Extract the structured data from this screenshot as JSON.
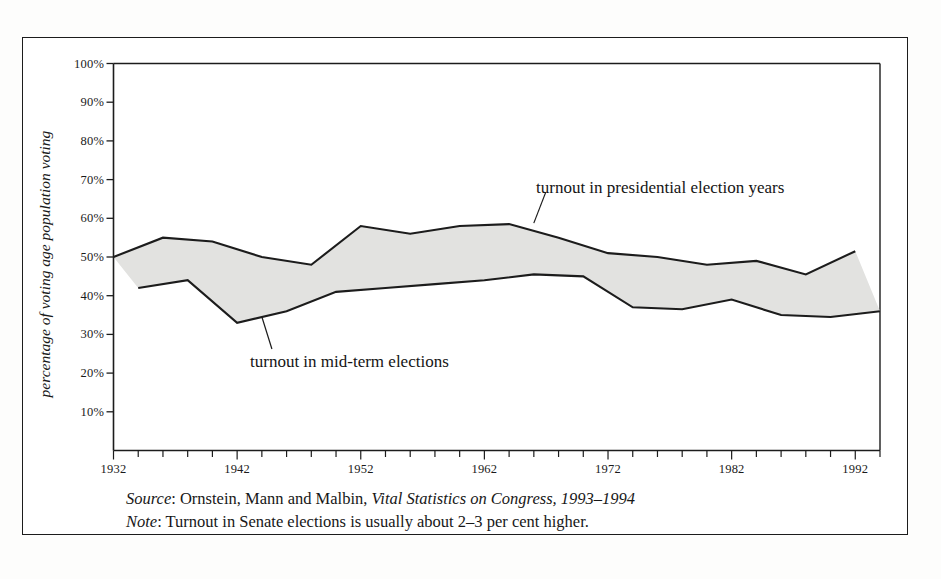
{
  "figure": {
    "y_axis_title": "percentage of voting age population voting",
    "annotations": {
      "presidential": "turnout in presidential election years",
      "midterm": "turnout in mid-term elections"
    },
    "footnotes": {
      "source_label": "Source",
      "source_sep": ": ",
      "source_text_a": "Ornstein, Mann and Malbin, ",
      "source_text_italic": "Vital Statistics on Congress, 1993–1994",
      "note_label": "Note",
      "note_sep": ": ",
      "note_text": "Turnout in Senate elections is usually about 2–3 per cent higher."
    },
    "colors": {
      "line": "#1c1c1c",
      "fill": "#e2e2e0",
      "frame": "#1c1c1c",
      "text": "#1a1a1a",
      "page": "#fdfdfc"
    }
  },
  "chart_data": {
    "type": "area",
    "title": "",
    "subtitle": "",
    "xlabel": "",
    "ylabel": "percentage of voting age population voting",
    "xlim": [
      1932,
      1994
    ],
    "ylim": [
      0,
      100
    ],
    "grid": false,
    "legend_position": "inline-annotations",
    "y_ticks": [
      10,
      20,
      30,
      40,
      50,
      60,
      70,
      80,
      90,
      100
    ],
    "y_tick_labels": [
      "10%",
      "20%",
      "30%",
      "40%",
      "50%",
      "60%",
      "70%",
      "80%",
      "90%",
      "100%"
    ],
    "x_ticks_minor_step": 2,
    "x_tick_labels": [
      "1932",
      "1942",
      "1952",
      "1962",
      "1972",
      "1982",
      "1992"
    ],
    "x_tick_label_years": [
      1932,
      1942,
      1952,
      1962,
      1972,
      1982,
      1992
    ],
    "series": [
      {
        "name": "turnout in presidential election years",
        "x": [
          1932,
          1936,
          1940,
          1944,
          1948,
          1952,
          1956,
          1960,
          1964,
          1968,
          1972,
          1976,
          1980,
          1984,
          1988,
          1992
        ],
        "values": [
          50,
          55,
          54,
          50,
          48,
          58,
          56,
          58,
          58.5,
          55,
          51,
          50,
          48,
          49,
          45.5,
          51.5
        ]
      },
      {
        "name": "turnout in mid-term elections",
        "x": [
          1934,
          1938,
          1942,
          1946,
          1950,
          1954,
          1958,
          1962,
          1966,
          1970,
          1974,
          1978,
          1982,
          1986,
          1990,
          1994
        ],
        "values": [
          42,
          44,
          33,
          36,
          41,
          42,
          43,
          44,
          45.5,
          45,
          37,
          36.5,
          39,
          35,
          34.5,
          36
        ]
      }
    ],
    "band_description": "Shaded grey band between the presidential-year turnout line (upper) and the mid-term turnout line (lower)."
  }
}
